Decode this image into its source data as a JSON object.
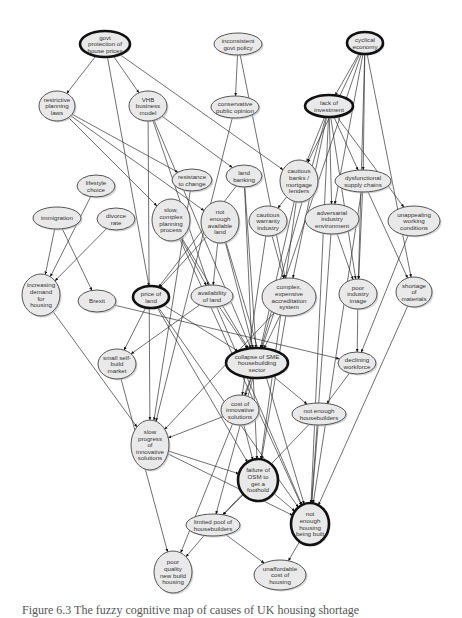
{
  "figure": {
    "caption": "Figure 6.3 The fuzzy cognitive map of causes of UK housing shortage"
  },
  "nodes": [
    {
      "id": "govt_protection",
      "label": [
        "govt",
        "protection of",
        "house prices"
      ],
      "x": 105,
      "y": 44,
      "rx": 25,
      "ry": 13,
      "bold": true
    },
    {
      "id": "inconsistent_policy",
      "label": [
        "inconsistent",
        "govt policy"
      ],
      "x": 238,
      "y": 44,
      "rx": 24,
      "ry": 11,
      "bold": false
    },
    {
      "id": "cyclical_economy",
      "label": [
        "cyclical",
        "economy"
      ],
      "x": 365,
      "y": 43,
      "rx": 18,
      "ry": 11,
      "bold": true
    },
    {
      "id": "restrictive_planning",
      "label": [
        "restrictive",
        "planning",
        "laws"
      ],
      "x": 57,
      "y": 106,
      "rx": 18,
      "ry": 15,
      "bold": false
    },
    {
      "id": "vhb_model",
      "label": [
        "VHB",
        "business",
        "model"
      ],
      "x": 148,
      "y": 106,
      "rx": 19,
      "ry": 15,
      "bold": false
    },
    {
      "id": "conservative_opinion",
      "label": [
        "conservative",
        "public opinion"
      ],
      "x": 235,
      "y": 107,
      "rx": 24,
      "ry": 11,
      "bold": false
    },
    {
      "id": "lack_investment",
      "label": [
        "lack of",
        "investment"
      ],
      "x": 329,
      "y": 106,
      "rx": 24,
      "ry": 11,
      "bold": true
    },
    {
      "id": "resistance_change",
      "label": [
        "resistance",
        "to change"
      ],
      "x": 192,
      "y": 180,
      "rx": 20,
      "ry": 11,
      "bold": false
    },
    {
      "id": "land_banking",
      "label": [
        "land",
        "banking"
      ],
      "x": 244,
      "y": 176,
      "rx": 18,
      "ry": 11,
      "bold": false
    },
    {
      "id": "cautious_banks",
      "label": [
        "cautious",
        "banks /",
        "mortgage",
        "lenders"
      ],
      "x": 299,
      "y": 181,
      "rx": 19,
      "ry": 21,
      "bold": false
    },
    {
      "id": "dysfunctional_supply",
      "label": [
        "dysfunctional",
        "supply chains"
      ],
      "x": 363,
      "y": 181,
      "rx": 28,
      "ry": 11,
      "bold": false
    },
    {
      "id": "lifestyle_choice",
      "label": [
        "lifestyle",
        "choice"
      ],
      "x": 96,
      "y": 186,
      "rx": 19,
      "ry": 11,
      "bold": false
    },
    {
      "id": "immigration",
      "label": [
        "immigration"
      ],
      "x": 57,
      "y": 218,
      "rx": 24,
      "ry": 11,
      "bold": false
    },
    {
      "id": "divorce_rate",
      "label": [
        "divorce",
        "rate"
      ],
      "x": 116,
      "y": 219,
      "rx": 19,
      "ry": 11,
      "bold": false
    },
    {
      "id": "slow_planning",
      "label": [
        "slow,",
        "complex",
        "planning",
        "process"
      ],
      "x": 171,
      "y": 220,
      "rx": 19,
      "ry": 21,
      "bold": false
    },
    {
      "id": "not_enough_land",
      "label": [
        "not",
        "enough",
        "available",
        "land"
      ],
      "x": 220,
      "y": 222,
      "rx": 19,
      "ry": 21,
      "bold": false
    },
    {
      "id": "cautious_warranty",
      "label": [
        "cautious",
        "warranty",
        "industry"
      ],
      "x": 268,
      "y": 221,
      "rx": 19,
      "ry": 15,
      "bold": false
    },
    {
      "id": "adversarial_env",
      "label": [
        "adversarial",
        "industry",
        "environment"
      ],
      "x": 332,
      "y": 219,
      "rx": 27,
      "ry": 15,
      "bold": false
    },
    {
      "id": "unappealing_conditions",
      "label": [
        "unappealing",
        "working",
        "conditions"
      ],
      "x": 414,
      "y": 221,
      "rx": 26,
      "ry": 15,
      "bold": false
    },
    {
      "id": "increasing_demand",
      "label": [
        "increasing",
        "demand",
        "for",
        "housing"
      ],
      "x": 41,
      "y": 295,
      "rx": 19,
      "ry": 21,
      "bold": false
    },
    {
      "id": "brexit",
      "label": [
        "Brexit"
      ],
      "x": 97,
      "y": 301,
      "rx": 19,
      "ry": 11,
      "bold": false
    },
    {
      "id": "price_of_land",
      "label": [
        "price of",
        "land"
      ],
      "x": 151,
      "y": 297,
      "rx": 18,
      "ry": 11,
      "bold": true
    },
    {
      "id": "availability_land",
      "label": [
        "availability",
        "of land"
      ],
      "x": 212,
      "y": 296,
      "rx": 21,
      "ry": 11,
      "bold": false
    },
    {
      "id": "complex_accreditation",
      "label": [
        "complex,",
        "expensive",
        "accreditation",
        "system"
      ],
      "x": 289,
      "y": 297,
      "rx": 27,
      "ry": 19,
      "bold": false
    },
    {
      "id": "poor_image",
      "label": [
        "poor",
        "industry",
        "image"
      ],
      "x": 358,
      "y": 294,
      "rx": 19,
      "ry": 15,
      "bold": false
    },
    {
      "id": "shortage_materials",
      "label": [
        "shortage",
        "of",
        "materials"
      ],
      "x": 414,
      "y": 292,
      "rx": 18,
      "ry": 15,
      "bold": false
    },
    {
      "id": "small_selfbuild",
      "label": [
        "small self-",
        "build",
        "market"
      ],
      "x": 117,
      "y": 364,
      "rx": 19,
      "ry": 15,
      "bold": false
    },
    {
      "id": "collapse_sme",
      "label": [
        "collapse of SME",
        "housebuilding",
        "sector"
      ],
      "x": 257,
      "y": 363,
      "rx": 31,
      "ry": 15,
      "bold": true
    },
    {
      "id": "declining_workforce",
      "label": [
        "declining",
        "workforce"
      ],
      "x": 357,
      "y": 363,
      "rx": 19,
      "ry": 11,
      "bold": false
    },
    {
      "id": "cost_innovative",
      "label": [
        "cost of",
        "innovative",
        "solutions"
      ],
      "x": 240,
      "y": 410,
      "rx": 19,
      "ry": 15,
      "bold": false
    },
    {
      "id": "not_enough_housebuilders",
      "label": [
        "not enough",
        "housebuilders"
      ],
      "x": 319,
      "y": 414,
      "rx": 27,
      "ry": 11,
      "bold": false
    },
    {
      "id": "slow_progress",
      "label": [
        "slow",
        "progress",
        "of",
        "innovative",
        "solutions"
      ],
      "x": 150,
      "y": 445,
      "rx": 19,
      "ry": 25,
      "bold": false
    },
    {
      "id": "failure_osm",
      "label": [
        "failure of",
        "OSM to",
        "get a",
        "foothold"
      ],
      "x": 258,
      "y": 480,
      "rx": 20,
      "ry": 21,
      "bold": true
    },
    {
      "id": "not_enough_housing",
      "label": [
        "not",
        "enough",
        "housing",
        "being built"
      ],
      "x": 310,
      "y": 524,
      "rx": 19,
      "ry": 21,
      "bold": true
    },
    {
      "id": "limited_pool",
      "label": [
        "limited pool of",
        "housebuilders"
      ],
      "x": 213,
      "y": 525,
      "rx": 27,
      "ry": 11,
      "bold": false
    },
    {
      "id": "poor_quality",
      "label": [
        "poor",
        "quality",
        "new build",
        "housing"
      ],
      "x": 173,
      "y": 572,
      "rx": 19,
      "ry": 21,
      "bold": false
    },
    {
      "id": "unaffordable_cost",
      "label": [
        "unaffordable",
        "cost of",
        "housing"
      ],
      "x": 280,
      "y": 575,
      "rx": 26,
      "ry": 15,
      "bold": false
    }
  ],
  "edges": [
    [
      "govt_protection",
      "restrictive_planning"
    ],
    [
      "govt_protection",
      "vhb_model"
    ],
    [
      "govt_protection",
      "price_of_land"
    ],
    [
      "govt_protection",
      "cautious_banks"
    ],
    [
      "inconsistent_policy",
      "conservative_opinion"
    ],
    [
      "inconsistent_policy",
      "complex_accreditation"
    ],
    [
      "conservative_opinion",
      "slow_progress"
    ],
    [
      "cyclical_economy",
      "lack_investment"
    ],
    [
      "cyclical_economy",
      "cautious_banks"
    ],
    [
      "cyclical_economy",
      "dysfunctional_supply"
    ],
    [
      "cyclical_economy",
      "adversarial_env"
    ],
    [
      "cyclical_economy",
      "poor_image"
    ],
    [
      "cyclical_economy",
      "shortage_materials"
    ],
    [
      "cyclical_economy",
      "collapse_sme"
    ],
    [
      "lack_investment",
      "cautious_banks"
    ],
    [
      "lack_investment",
      "dysfunctional_supply"
    ],
    [
      "lack_investment",
      "adversarial_env"
    ],
    [
      "lack_investment",
      "unappealing_conditions"
    ],
    [
      "lack_investment",
      "poor_image"
    ],
    [
      "lack_investment",
      "complex_accreditation"
    ],
    [
      "lack_investment",
      "collapse_sme"
    ],
    [
      "lack_investment",
      "not_enough_housing"
    ],
    [
      "restrictive_planning",
      "resistance_change"
    ],
    [
      "restrictive_planning",
      "slow_planning"
    ],
    [
      "restrictive_planning",
      "not_enough_land"
    ],
    [
      "vhb_model",
      "land_banking"
    ],
    [
      "vhb_model",
      "availability_land"
    ],
    [
      "vhb_model",
      "collapse_sme"
    ],
    [
      "vhb_model",
      "slow_progress"
    ],
    [
      "resistance_change",
      "slow_progress"
    ],
    [
      "land_banking",
      "price_of_land"
    ],
    [
      "land_banking",
      "collapse_sme"
    ],
    [
      "land_banking",
      "failure_osm"
    ],
    [
      "cautious_banks",
      "cautious_warranty"
    ],
    [
      "cautious_banks",
      "collapse_sme"
    ],
    [
      "cautious_banks",
      "failure_osm"
    ],
    [
      "cautious_warranty",
      "complex_accreditation"
    ],
    [
      "cautious_warranty",
      "cost_innovative"
    ],
    [
      "dysfunctional_supply",
      "poor_image"
    ],
    [
      "dysfunctional_supply",
      "shortage_materials"
    ],
    [
      "dysfunctional_supply",
      "not_enough_housing"
    ],
    [
      "adversarial_env",
      "poor_image"
    ],
    [
      "adversarial_env",
      "not_enough_housing"
    ],
    [
      "unappealing_conditions",
      "declining_workforce"
    ],
    [
      "lifestyle_choice",
      "increasing_demand"
    ],
    [
      "immigration",
      "increasing_demand"
    ],
    [
      "immigration",
      "brexit"
    ],
    [
      "divorce_rate",
      "increasing_demand"
    ],
    [
      "slow_planning",
      "availability_land"
    ],
    [
      "slow_planning",
      "collapse_sme"
    ],
    [
      "slow_planning",
      "not_enough_housing"
    ],
    [
      "not_enough_land",
      "price_of_land"
    ],
    [
      "not_enough_land",
      "availability_land"
    ],
    [
      "not_enough_land",
      "collapse_sme"
    ],
    [
      "not_enough_land",
      "not_enough_housing"
    ],
    [
      "increasing_demand",
      "slow_progress"
    ],
    [
      "brexit",
      "declining_workforce"
    ],
    [
      "price_of_land",
      "small_selfbuild"
    ],
    [
      "price_of_land",
      "collapse_sme"
    ],
    [
      "price_of_land",
      "failure_osm"
    ],
    [
      "price_of_land",
      "not_enough_housing"
    ],
    [
      "availability_land",
      "small_selfbuild"
    ],
    [
      "availability_land",
      "collapse_sme"
    ],
    [
      "availability_land",
      "not_enough_housing"
    ],
    [
      "complex_accreditation",
      "collapse_sme"
    ],
    [
      "complex_accreditation",
      "failure_osm"
    ],
    [
      "complex_accreditation",
      "slow_progress"
    ],
    [
      "poor_image",
      "declining_workforce"
    ],
    [
      "shortage_materials",
      "not_enough_housing"
    ],
    [
      "small_selfbuild",
      "poor_quality"
    ],
    [
      "collapse_sme",
      "cost_innovative"
    ],
    [
      "collapse_sme",
      "not_enough_housebuilders"
    ],
    [
      "collapse_sme",
      "limited_pool"
    ],
    [
      "collapse_sme",
      "poor_quality"
    ],
    [
      "declining_workforce",
      "not_enough_housebuilders"
    ],
    [
      "cost_innovative",
      "slow_progress"
    ],
    [
      "cost_innovative",
      "failure_osm"
    ],
    [
      "not_enough_housebuilders",
      "not_enough_housing"
    ],
    [
      "not_enough_housebuilders",
      "limited_pool"
    ],
    [
      "slow_progress",
      "failure_osm"
    ],
    [
      "slow_progress",
      "not_enough_housing"
    ],
    [
      "failure_osm",
      "limited_pool"
    ],
    [
      "failure_osm",
      "not_enough_housing"
    ],
    [
      "limited_pool",
      "poor_quality"
    ],
    [
      "limited_pool",
      "unaffordable_cost"
    ],
    [
      "not_enough_housing",
      "unaffordable_cost"
    ]
  ],
  "colors": {
    "node_fill": "#e9e9e9",
    "node_stroke": "#555555",
    "bold_stroke": "#111111",
    "edge": "#333333",
    "text": "#333333"
  }
}
